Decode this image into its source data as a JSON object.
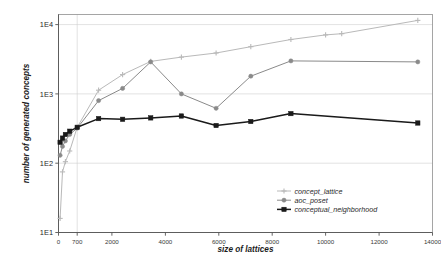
{
  "chart_data": {
    "type": "line",
    "title": "",
    "xlabel": "size of lattices",
    "ylabel": "number of generated concepts",
    "xlim": [
      0,
      14000
    ],
    "ylim": [
      10,
      14000
    ],
    "yscale": "log",
    "grid": true,
    "legend_position": "inside-right-lower",
    "xticks": [
      "0",
      "700",
      "2000",
      "4000",
      "6000",
      "8000",
      "10000",
      "12000",
      "14000"
    ],
    "xtick_values": [
      0,
      700,
      2000,
      4000,
      6000,
      8000,
      10000,
      12000,
      14000
    ],
    "yticks": [
      "1E1",
      "1E2",
      "1E3",
      "1E4"
    ],
    "ytick_values": [
      10,
      100,
      1000,
      10000
    ],
    "series": [
      {
        "name": "concept_lattice",
        "color": "#b9b9b9",
        "marker": "plus",
        "x": [
          60,
          150,
          260,
          420,
          700,
          1500,
          2400,
          3450,
          4600,
          5900,
          7200,
          8700,
          10000,
          10600,
          13450
        ],
        "y": [
          16,
          75,
          105,
          150,
          330,
          1130,
          1900,
          2950,
          3400,
          3900,
          4800,
          6100,
          7100,
          7400,
          11500
        ]
      },
      {
        "name": "aoc_poset",
        "color": "#8a8a8a",
        "marker": "circle",
        "x": [
          60,
          150,
          260,
          420,
          700,
          1500,
          2400,
          3450,
          4600,
          5900,
          7200,
          8700,
          13450
        ],
        "y": [
          130,
          175,
          210,
          260,
          320,
          800,
          1200,
          2900,
          1000,
          620,
          1800,
          3000,
          2900
        ]
      },
      {
        "name": "conceptual_neighborhood",
        "color": "#1a1a1a",
        "marker": "square",
        "x": [
          60,
          150,
          260,
          420,
          700,
          1500,
          2400,
          3450,
          4600,
          5900,
          7200,
          8700,
          13450
        ],
        "y": [
          200,
          230,
          260,
          290,
          330,
          440,
          430,
          450,
          480,
          350,
          400,
          520,
          380
        ]
      }
    ]
  },
  "legend": {
    "items": [
      {
        "label": "concept_lattice"
      },
      {
        "label": "aoc_poset"
      },
      {
        "label": "conceptual_neighborhood"
      }
    ]
  }
}
